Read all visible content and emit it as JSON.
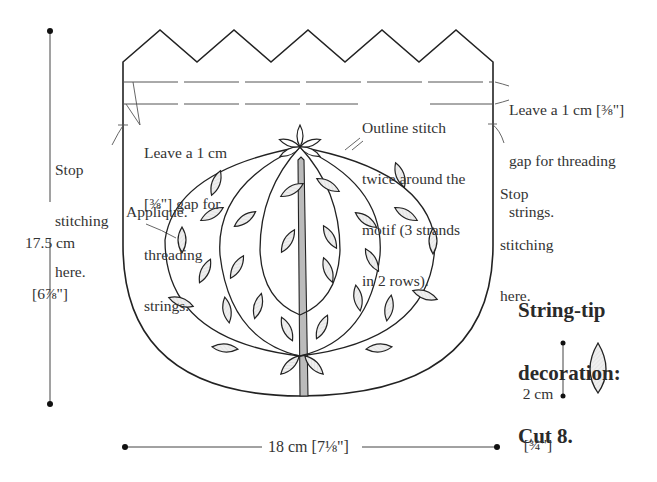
{
  "diagram": {
    "type": "sewing-pattern",
    "colors": {
      "outline": "#222222",
      "leaf_fill": "#eeeeee",
      "stem_fill": "#bbbbbb",
      "dashed_line": "#555555",
      "text": "#333333"
    },
    "labels": {
      "height_dim_line1": "17.5 cm",
      "height_dim_line2": "[6⅞\"]",
      "width_dim": "18 cm [7⅛\"]",
      "stop_left_line1": "Stop",
      "stop_left_line2": "stitching",
      "stop_left_line3": "here.",
      "gap_left_line1": "Leave a 1 cm",
      "gap_left_line2": "[⅜\"] gap for",
      "gap_left_line3": "threading",
      "gap_left_line4": "strings.",
      "applique": "Appliqué.",
      "outline_line1": "Outline stitch",
      "outline_line2": "twice around the",
      "outline_line3": "motif (3 strands",
      "outline_line4": "in 2 rows).",
      "gap_right_line1": "Leave a 1 cm [⅜\"]",
      "gap_right_line2": "gap for threading",
      "gap_right_line3": "strings.",
      "stop_right_line1": "Stop",
      "stop_right_line2": "stitching",
      "stop_right_line3": "here."
    },
    "string_tip": {
      "title_line1": "String-tip",
      "title_line2": "decoration:",
      "title_line3": "Cut 8.",
      "dim_line1": "2 cm",
      "dim_line2": "[¾\"]"
    }
  }
}
